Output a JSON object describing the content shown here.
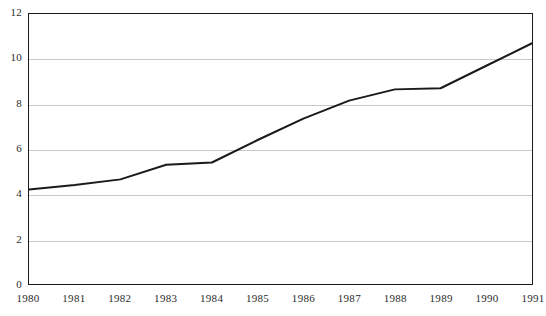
{
  "chart_data": {
    "type": "line",
    "title": "",
    "subtitle": "",
    "xlabel": "",
    "ylabel": "",
    "categories": [
      "1980",
      "1981",
      "1982",
      "1983",
      "1984",
      "1985",
      "1986",
      "1987",
      "1988",
      "1989",
      "1990",
      "1991"
    ],
    "x": [
      1980,
      1981,
      1982,
      1983,
      1984,
      1985,
      1986,
      1987,
      1988,
      1989,
      1990,
      1991
    ],
    "values": [
      4.2,
      4.4,
      4.65,
      5.3,
      5.4,
      6.4,
      7.35,
      8.15,
      8.65,
      8.7,
      9.7,
      10.7
    ],
    "series": [
      {
        "name": "series-1",
        "values": [
          4.2,
          4.4,
          4.65,
          5.3,
          5.4,
          6.4,
          7.35,
          8.15,
          8.65,
          8.7,
          9.7,
          10.7
        ],
        "color": "#1a1a1a"
      }
    ],
    "ylim": [
      0,
      12
    ],
    "xlim": [
      1980,
      1991
    ],
    "y_ticks": [
      0,
      2,
      4,
      6,
      8,
      10,
      12
    ],
    "y_tick_labels": [
      "0",
      "2",
      "4",
      "6",
      "8",
      "10",
      "12"
    ],
    "x_ticks": [
      1980,
      1981,
      1982,
      1983,
      1984,
      1985,
      1986,
      1987,
      1988,
      1989,
      1990,
      1991
    ],
    "x_tick_labels": [
      "1980",
      "1981",
      "1982",
      "1983",
      "1984",
      "1985",
      "1986",
      "1987",
      "1988",
      "1989",
      "1990",
      "1991"
    ],
    "grid": true,
    "grid_axis": "y",
    "grid_color": "#c9c9c9",
    "legend": false,
    "legend_position": "none",
    "frame_color": "#1a1a1a",
    "background_color": "#ffffff",
    "line_color": "#1a1a1a",
    "line_width": 2,
    "markers": false,
    "annotations": []
  }
}
